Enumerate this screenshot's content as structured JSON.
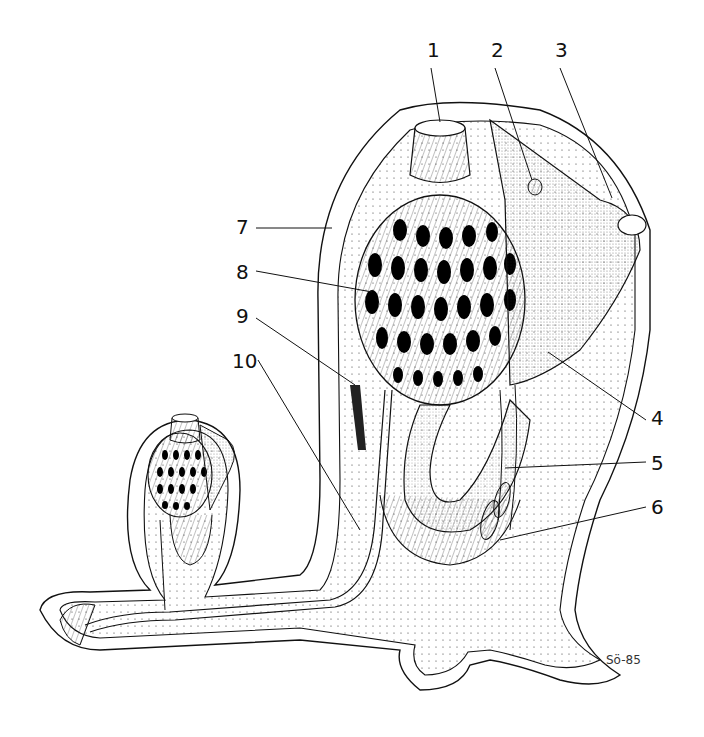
{
  "figure": {
    "type": "anatomical line drawing",
    "labels": [
      {
        "id": "1",
        "text": "1",
        "x": 427,
        "y": 40
      },
      {
        "id": "2",
        "text": "2",
        "x": 492,
        "y": 40
      },
      {
        "id": "3",
        "text": "3",
        "x": 556,
        "y": 40
      },
      {
        "id": "4",
        "text": "4",
        "x": 652,
        "y": 408
      },
      {
        "id": "5",
        "text": "5",
        "x": 652,
        "y": 453
      },
      {
        "id": "6",
        "text": "6",
        "x": 652,
        "y": 497
      },
      {
        "id": "7",
        "text": "7",
        "x": 236,
        "y": 217
      },
      {
        "id": "8",
        "text": "8",
        "x": 236,
        "y": 262
      },
      {
        "id": "9",
        "text": "9",
        "x": 236,
        "y": 306
      },
      {
        "id": "10",
        "text": "10",
        "x": 236,
        "y": 351
      }
    ],
    "signature": "Sö-85"
  }
}
